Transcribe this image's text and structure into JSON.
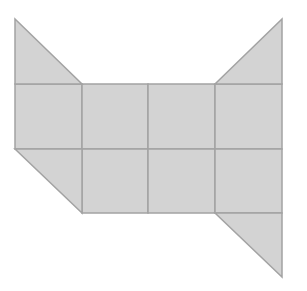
{
  "diagram": {
    "title": "",
    "colors": {
      "background": "#ffffff",
      "fill": "#d3d3d3",
      "stroke": "#a3a3a3"
    },
    "grid": {
      "columns": 4,
      "rows": 2,
      "x_lines": [
        15,
        82,
        148,
        215,
        282
      ],
      "y_lines": [
        84,
        149,
        213
      ]
    },
    "triangles": [
      {
        "name": "top-left-ear",
        "points": "15,19 15,84 82,84"
      },
      {
        "name": "top-right-ear",
        "points": "282,19 282,84 215,84"
      },
      {
        "name": "bottom-left-corner",
        "points": "15,149 82,149 82,213"
      },
      {
        "name": "bottom-right-tail",
        "points": "215,213 282,213 282,277"
      }
    ],
    "squares": [
      {
        "name": "square-r1-c1",
        "x": 15,
        "y": 84,
        "w": 67,
        "h": 65
      },
      {
        "name": "square-r1-c2",
        "x": 82,
        "y": 84,
        "w": 66,
        "h": 65
      },
      {
        "name": "square-r1-c3",
        "x": 148,
        "y": 84,
        "w": 67,
        "h": 65
      },
      {
        "name": "square-r1-c4",
        "x": 215,
        "y": 84,
        "w": 67,
        "h": 65
      },
      {
        "name": "square-r2-c2",
        "x": 82,
        "y": 149,
        "w": 66,
        "h": 64
      },
      {
        "name": "square-r2-c3",
        "x": 148,
        "y": 149,
        "w": 67,
        "h": 64
      },
      {
        "name": "square-r2-c4",
        "x": 215,
        "y": 149,
        "w": 67,
        "h": 64
      }
    ]
  }
}
